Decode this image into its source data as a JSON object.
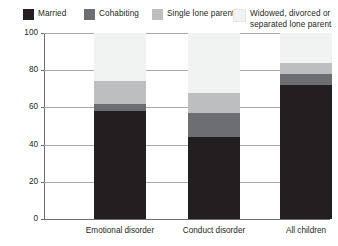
{
  "legend": {
    "items": [
      {
        "label": "Married",
        "color": "#231f20"
      },
      {
        "label": "Cohabiting",
        "color": "#6d6e71"
      },
      {
        "label": "Single lone parent",
        "color": "#bcbec0"
      },
      {
        "label": "Widowed, divorced or\nseparated lone parent",
        "color": "#f1f2f2"
      }
    ]
  },
  "axes": {
    "ylabel": "Percentage",
    "yticks": [
      "0",
      "20",
      "40",
      "60",
      "80",
      "100"
    ],
    "xticks": [
      "Emotional disorder",
      "Conduct disorder",
      "All children"
    ]
  },
  "chart_data": {
    "type": "bar",
    "subtype": "stacked-100",
    "title": "",
    "xlabel": "",
    "ylabel": "Percentage",
    "ylim": [
      0,
      100
    ],
    "yticks": [
      0,
      20,
      40,
      60,
      80,
      100
    ],
    "grid": true,
    "legend_position": "top",
    "categories": [
      "Emotional disorder",
      "Conduct disorder",
      "All children"
    ],
    "series": [
      {
        "name": "Married",
        "color": "#231f20",
        "values": [
          58,
          44,
          72
        ]
      },
      {
        "name": "Cohabiting",
        "color": "#6d6e71",
        "values": [
          4,
          13,
          6
        ]
      },
      {
        "name": "Single lone parent",
        "color": "#bcbec0",
        "values": [
          12,
          11,
          6
        ]
      },
      {
        "name": "Widowed, divorced or separated lone parent",
        "color": "#f1f2f2",
        "values": [
          26,
          32,
          16
        ]
      }
    ]
  }
}
